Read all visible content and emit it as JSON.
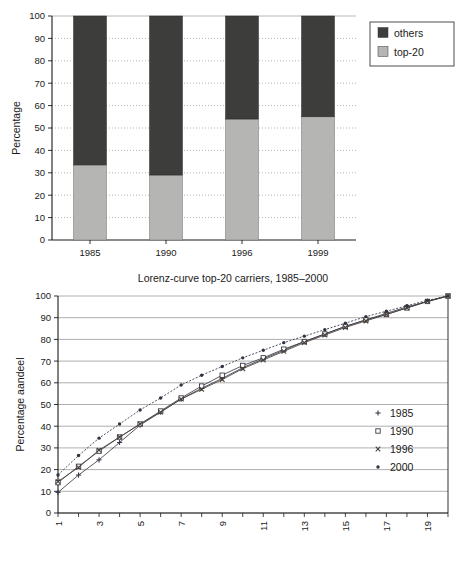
{
  "bar_chart": {
    "y_axis_label": "Percentage",
    "legend": [
      {
        "label": "others",
        "color": "#3d3d3b"
      },
      {
        "label": "top-20",
        "color": "#b5b5b3"
      }
    ],
    "chart_data": {
      "type": "bar",
      "title": "",
      "xlabel": "",
      "ylabel": "Percentage",
      "ylim": [
        0,
        100
      ],
      "yticks": [
        0,
        10,
        20,
        30,
        40,
        50,
        60,
        70,
        80,
        90,
        100
      ],
      "grid": true,
      "stacked": true,
      "categories": [
        "1985",
        "1990",
        "1996",
        "1999"
      ],
      "series": [
        {
          "name": "top-20",
          "color": "#b5b5b3",
          "values": [
            33.5,
            29,
            54,
            55
          ]
        },
        {
          "name": "others",
          "color": "#3d3d3b",
          "values": [
            66.5,
            71,
            46,
            45
          ]
        }
      ]
    }
  },
  "lorenz_chart": {
    "title": "Lorenz-curve top-20 carriers, 1985–2000",
    "y_axis_label": "Percentage aandeel",
    "legend": [
      {
        "label": "1985",
        "marker": "plus"
      },
      {
        "label": "1990",
        "marker": "open-square"
      },
      {
        "label": "1996",
        "marker": "cross"
      },
      {
        "label": "2000",
        "marker": "dot"
      }
    ],
    "chart_data": {
      "type": "line",
      "title": "Lorenz-curve top-20 carriers, 1985–2000",
      "xlabel": "",
      "ylabel": "Percentage aandeel",
      "ylim": [
        0,
        100
      ],
      "xlim": [
        1,
        20
      ],
      "yticks": [
        0,
        10,
        20,
        30,
        40,
        50,
        60,
        70,
        80,
        90,
        100
      ],
      "xticks": [
        1,
        3,
        5,
        7,
        9,
        11,
        13,
        15,
        17,
        19
      ],
      "grid": true,
      "legend_position": "right",
      "x": [
        1,
        2,
        3,
        4,
        5,
        6,
        7,
        8,
        9,
        10,
        11,
        12,
        13,
        14,
        15,
        16,
        17,
        18,
        19,
        20
      ],
      "series": [
        {
          "name": "1985",
          "marker": "plus",
          "color": "#3a3a48",
          "values": [
            9.5,
            17.5,
            24.5,
            32.5,
            40.5,
            46.5,
            52.5,
            57.5,
            62.0,
            67.0,
            71.0,
            75.0,
            79.0,
            82.5,
            86.0,
            89.0,
            92.0,
            95.0,
            97.5,
            100
          ]
        },
        {
          "name": "1990",
          "marker": "open-square",
          "color": "#3a3a48",
          "values": [
            14.0,
            21.5,
            28.5,
            35.0,
            41.0,
            47.0,
            53.0,
            58.5,
            63.5,
            68.0,
            71.5,
            75.5,
            79.0,
            82.5,
            86.0,
            89.0,
            91.5,
            94.5,
            97.5,
            100
          ]
        },
        {
          "name": "1996",
          "marker": "cross",
          "color": "#4a4038",
          "values": [
            14.5,
            21.0,
            29.0,
            35.0,
            41.0,
            46.5,
            52.5,
            57.0,
            61.5,
            66.5,
            70.5,
            74.5,
            78.5,
            82.0,
            85.5,
            88.5,
            91.5,
            94.5,
            97.5,
            100
          ]
        },
        {
          "name": "2000",
          "marker": "dot",
          "color": "#2f3340",
          "values": [
            17.5,
            26.5,
            34.5,
            41.0,
            47.5,
            53.0,
            59.0,
            63.5,
            67.5,
            71.5,
            75.0,
            78.5,
            81.5,
            84.5,
            87.5,
            90.5,
            93.0,
            95.5,
            98.0,
            100
          ]
        }
      ]
    }
  }
}
